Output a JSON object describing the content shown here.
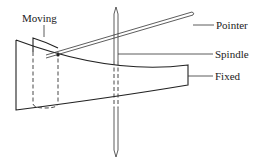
{
  "figure": {
    "type": "moving-vane instrument sketch",
    "labels": {
      "moving": "Moving",
      "pointer": "Pointer",
      "spindle": "Spindle",
      "fixed": "Fixed"
    },
    "colors": {
      "stroke": "#222222",
      "background": "#ffffff"
    }
  }
}
